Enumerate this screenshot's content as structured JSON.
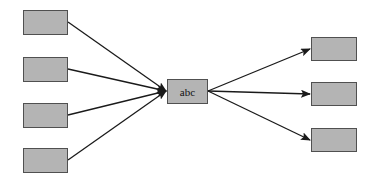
{
  "diagram": {
    "type": "fan-in-fan-out",
    "colors": {
      "node_fill": "#b4b4b4",
      "node_border": "#505050",
      "edge": "#1a1a1a",
      "background": "#ffffff"
    },
    "center_node": {
      "id": "center",
      "label": "abc",
      "x": 167,
      "y": 79,
      "w": 41,
      "h": 25
    },
    "input_nodes": [
      {
        "id": "in1",
        "label": "",
        "x": 23,
        "y": 10,
        "w": 45,
        "h": 25
      },
      {
        "id": "in2",
        "label": "",
        "x": 23,
        "y": 57,
        "w": 45,
        "h": 25
      },
      {
        "id": "in3",
        "label": "",
        "x": 23,
        "y": 103,
        "w": 45,
        "h": 25
      },
      {
        "id": "in4",
        "label": "",
        "x": 23,
        "y": 148,
        "w": 45,
        "h": 25
      }
    ],
    "output_nodes": [
      {
        "id": "out1",
        "label": "",
        "x": 311,
        "y": 37,
        "w": 46,
        "h": 24
      },
      {
        "id": "out2",
        "label": "",
        "x": 311,
        "y": 82,
        "w": 46,
        "h": 24
      },
      {
        "id": "out3",
        "label": "",
        "x": 311,
        "y": 128,
        "w": 46,
        "h": 24
      }
    ],
    "edges": [
      {
        "from": "in1",
        "to": "center",
        "x1": 68,
        "y1": 22,
        "x2": 166,
        "y2": 91
      },
      {
        "from": "in2",
        "to": "center",
        "x1": 68,
        "y1": 69,
        "x2": 166,
        "y2": 91
      },
      {
        "from": "in3",
        "to": "center",
        "x1": 68,
        "y1": 115,
        "x2": 166,
        "y2": 91
      },
      {
        "from": "in4",
        "to": "center",
        "x1": 68,
        "y1": 160,
        "x2": 166,
        "y2": 91
      },
      {
        "from": "center",
        "to": "out1",
        "x1": 208,
        "y1": 91,
        "x2": 310,
        "y2": 49
      },
      {
        "from": "center",
        "to": "out2",
        "x1": 208,
        "y1": 91,
        "x2": 310,
        "y2": 94
      },
      {
        "from": "center",
        "to": "out3",
        "x1": 208,
        "y1": 91,
        "x2": 310,
        "y2": 140
      }
    ]
  }
}
